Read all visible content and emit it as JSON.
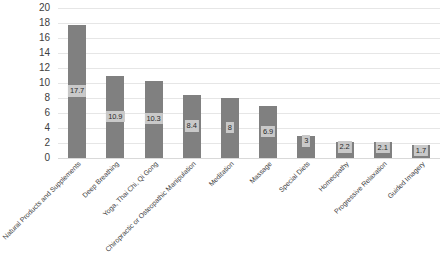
{
  "chart_data": {
    "type": "bar",
    "title": "",
    "subtitle": "",
    "xlabel": "",
    "ylabel": "",
    "ylim": [
      0,
      20
    ],
    "ytick_step": 2,
    "yticks": [
      "20",
      "18",
      "16",
      "14",
      "12",
      "10",
      "8",
      "6",
      "4",
      "2",
      "0"
    ],
    "grid": true,
    "legend": "none",
    "bar_color": "#808080",
    "label_background": "#c9c9c9",
    "gridline_color": "#e6e6e6",
    "categories": [
      "Natural Products and Supplements",
      "Deep Breathing",
      "Yoga, Thai Chi, Qi Gong",
      "Chiropractic or Osteopathic Manipulation",
      "Meditation",
      "Massage",
      "Special Diets",
      "Homeopathy",
      "Progressive Relaxation",
      "Guided Imagery"
    ],
    "values": [
      17.7,
      10.9,
      10.3,
      8.4,
      8,
      6.9,
      3,
      2.2,
      2.1,
      1.7
    ],
    "value_labels": [
      "17.7",
      "10.9",
      "10.3",
      "8.4",
      "8",
      "6.9",
      "3",
      "2.2",
      "2.1",
      "1.7"
    ]
  }
}
